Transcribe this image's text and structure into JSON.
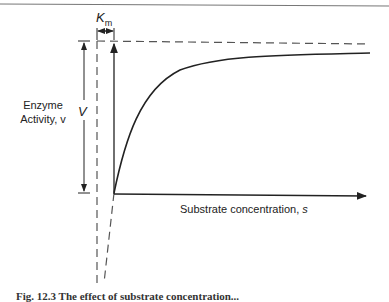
{
  "diagram": {
    "type": "michaelis-menten saturation curve",
    "y_axis_label_line1": "Enzyme",
    "y_axis_label_line2": "Activity, v",
    "vmax_label": "V",
    "km_label": "K",
    "km_subscript": "m",
    "x_axis_label": "Substrate concentration, ",
    "x_axis_var": "s",
    "caption": "Fig. 12.3   The effect of substrate concentration..."
  },
  "colors": {
    "line": "#222222",
    "dashed": "#555555"
  }
}
